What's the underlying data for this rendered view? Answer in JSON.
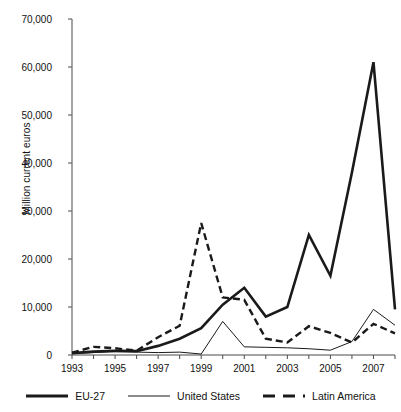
{
  "chart_data": {
    "type": "line",
    "title": "",
    "xlabel": "",
    "ylabel": "Million current euros",
    "x": [
      1993,
      1994,
      1995,
      1996,
      1997,
      1998,
      1999,
      2000,
      2001,
      2002,
      2003,
      2004,
      2005,
      2006,
      2007,
      2008
    ],
    "xtick_labels": [
      "1993",
      "1995",
      "1997",
      "1999",
      "2001",
      "2003",
      "2005",
      "2007"
    ],
    "xtick_years": [
      1993,
      1995,
      1997,
      1999,
      2001,
      2003,
      2005,
      2007
    ],
    "ytick_labels": [
      "0",
      "10,000",
      "20,000",
      "30,000",
      "40,000",
      "50,000",
      "60,000",
      "70,000"
    ],
    "ytick_values": [
      0,
      10000,
      20000,
      30000,
      40000,
      50000,
      60000,
      70000
    ],
    "ylim": [
      0,
      70000
    ],
    "xlim": [
      1993,
      2008
    ],
    "grid": false,
    "legend_position": "bottom",
    "series": [
      {
        "name": "EU-27",
        "style": "solid-thick",
        "color": "#1a1a1a",
        "width": 2.6,
        "values": [
          400,
          700,
          900,
          800,
          1900,
          3400,
          5600,
          10500,
          14000,
          8000,
          10000,
          25000,
          16500,
          38000,
          61000,
          9500
        ]
      },
      {
        "name": "United States",
        "style": "solid-thin",
        "color": "#1a1a1a",
        "width": 1.0,
        "values": [
          300,
          500,
          700,
          600,
          500,
          600,
          200,
          7000,
          1700,
          1600,
          1500,
          1300,
          1000,
          2800,
          9500,
          6200
        ]
      },
      {
        "name": "Latin America",
        "style": "dashed",
        "color": "#1a1a1a",
        "width": 2.4,
        "values": [
          500,
          1700,
          1400,
          900,
          3700,
          6100,
          27500,
          12000,
          11500,
          3400,
          2600,
          6000,
          4600,
          2600,
          6500,
          4500
        ]
      }
    ]
  },
  "legend": {
    "items": [
      {
        "label": "EU-27",
        "style": "solid-thick"
      },
      {
        "label": "United States",
        "style": "solid-thin"
      },
      {
        "label": "Latin America",
        "style": "dashed"
      }
    ]
  },
  "axis": {
    "y_title": "Million current euros"
  }
}
